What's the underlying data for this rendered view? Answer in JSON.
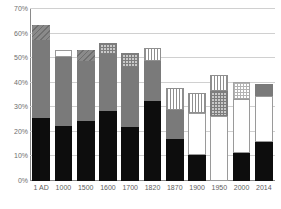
{
  "chart_data": {
    "type": "bar",
    "title": "",
    "subtitle": "",
    "xlabel": "",
    "ylabel": "",
    "stacked": true,
    "grid": true,
    "legend_position": "none",
    "ylim": [
      0,
      70
    ],
    "ytick_labels": [
      "0%",
      "10%",
      "20%",
      "30%",
      "40%",
      "50%",
      "60%",
      "70%"
    ],
    "ytick_values": [
      0,
      10,
      20,
      30,
      40,
      50,
      60,
      70
    ],
    "categories": [
      "1 AD",
      "1000",
      "1500",
      "1600",
      "1700",
      "1820",
      "1870",
      "1900",
      "1950",
      "2000",
      "2014"
    ],
    "series": [
      {
        "name": "segment-1",
        "fill": "black",
        "values": [
          25.5,
          22.5,
          24.5,
          28.5,
          22.0,
          32.5,
          17.0,
          10.5,
          0.0,
          11.5,
          16.0
        ]
      },
      {
        "name": "segment-2",
        "fill": "gray",
        "values": [
          32.0,
          28.0,
          24.5,
          23.0,
          24.5,
          16.5,
          12.0,
          0.0,
          0.0,
          0.0,
          0.0
        ]
      },
      {
        "name": "segment-3",
        "fill": "white",
        "values": [
          0.0,
          3.0,
          0.0,
          0.0,
          0.0,
          0.0,
          0.0,
          17.0,
          26.5,
          22.0,
          18.5
        ]
      },
      {
        "name": "segment-4",
        "fill": "pattern",
        "values": [
          6.0,
          0.0,
          4.5,
          4.5,
          5.5,
          5.0,
          9.0,
          8.5,
          10.0,
          7.0,
          5.0
        ]
      },
      {
        "name": "segment-5",
        "fill": "pattern-top",
        "values": [
          0.0,
          0.0,
          0.0,
          0.0,
          0.0,
          0.0,
          0.0,
          0.0,
          6.5,
          0.0,
          0.0
        ]
      }
    ],
    "totals": [
      63.5,
      53.5,
      53.5,
      56.0,
      52.0,
      54.0,
      38.0,
      36.0,
      43.0,
      40.5,
      39.5
    ],
    "bars": [
      {
        "category": "1 AD",
        "total": 63.5,
        "segments": [
          {
            "fill": "black",
            "value": 25.5,
            "from": 0.0,
            "to": 25.5
          },
          {
            "fill": "gray",
            "value": 32.0,
            "from": 25.5,
            "to": 57.5
          },
          {
            "fill": "diag",
            "value": 6.0,
            "from": 57.5,
            "to": 63.5
          }
        ]
      },
      {
        "category": "1000",
        "total": 53.5,
        "segments": [
          {
            "fill": "black",
            "value": 22.5,
            "from": 0.0,
            "to": 22.5
          },
          {
            "fill": "gray",
            "value": 28.0,
            "from": 22.5,
            "to": 50.5
          },
          {
            "fill": "white",
            "value": 3.0,
            "from": 50.5,
            "to": 53.5
          }
        ]
      },
      {
        "category": "1500",
        "total": 53.5,
        "segments": [
          {
            "fill": "black",
            "value": 24.5,
            "from": 0.0,
            "to": 24.5
          },
          {
            "fill": "gray",
            "value": 24.5,
            "from": 24.5,
            "to": 49.0
          },
          {
            "fill": "diag",
            "value": 4.5,
            "from": 49.0,
            "to": 53.5
          }
        ]
      },
      {
        "category": "1600",
        "total": 56.0,
        "segments": [
          {
            "fill": "black",
            "value": 28.5,
            "from": 0.0,
            "to": 28.5
          },
          {
            "fill": "gray",
            "value": 23.0,
            "from": 28.5,
            "to": 51.5
          },
          {
            "fill": "crosshatch",
            "value": 4.5,
            "from": 51.5,
            "to": 56.0
          }
        ]
      },
      {
        "category": "1700",
        "total": 52.0,
        "segments": [
          {
            "fill": "black",
            "value": 22.0,
            "from": 0.0,
            "to": 22.0
          },
          {
            "fill": "gray",
            "value": 24.5,
            "from": 22.0,
            "to": 46.5
          },
          {
            "fill": "crosshatch",
            "value": 5.5,
            "from": 46.5,
            "to": 52.0
          }
        ]
      },
      {
        "category": "1820",
        "total": 54.0,
        "segments": [
          {
            "fill": "black",
            "value": 32.5,
            "from": 0.0,
            "to": 32.5
          },
          {
            "fill": "gray",
            "value": 16.5,
            "from": 32.5,
            "to": 49.0
          },
          {
            "fill": "vstripe",
            "value": 5.0,
            "from": 49.0,
            "to": 54.0
          }
        ]
      },
      {
        "category": "1870",
        "total": 38.0,
        "segments": [
          {
            "fill": "black",
            "value": 17.0,
            "from": 0.0,
            "to": 17.0
          },
          {
            "fill": "gray",
            "value": 12.0,
            "from": 17.0,
            "to": 29.0
          },
          {
            "fill": "vstripe",
            "value": 9.0,
            "from": 29.0,
            "to": 38.0
          }
        ]
      },
      {
        "category": "1900",
        "total": 36.0,
        "segments": [
          {
            "fill": "black",
            "value": 10.5,
            "from": 0.0,
            "to": 10.5
          },
          {
            "fill": "white",
            "value": 17.0,
            "from": 10.5,
            "to": 27.5
          },
          {
            "fill": "vstripe",
            "value": 8.5,
            "from": 27.5,
            "to": 36.0
          }
        ]
      },
      {
        "category": "1950",
        "total": 43.0,
        "segments": [
          {
            "fill": "white",
            "value": 26.5,
            "from": 0.0,
            "to": 26.5
          },
          {
            "fill": "crosshatch",
            "value": 10.0,
            "from": 26.5,
            "to": 36.5
          },
          {
            "fill": "vstripe",
            "value": 6.5,
            "from": 36.5,
            "to": 43.0
          }
        ]
      },
      {
        "category": "2000",
        "total": 40.5,
        "segments": [
          {
            "fill": "black",
            "value": 11.5,
            "from": 0.0,
            "to": 11.5
          },
          {
            "fill": "white",
            "value": 22.0,
            "from": 11.5,
            "to": 33.5
          },
          {
            "fill": "checker-light",
            "value": 7.0,
            "from": 33.5,
            "to": 40.5
          }
        ]
      },
      {
        "category": "2014",
        "total": 39.5,
        "segments": [
          {
            "fill": "black",
            "value": 16.0,
            "from": 0.0,
            "to": 16.0
          },
          {
            "fill": "white",
            "value": 18.5,
            "from": 16.0,
            "to": 34.5
          },
          {
            "fill": "gray",
            "value": 5.0,
            "from": 34.5,
            "to": 39.5
          }
        ]
      }
    ],
    "colors": {
      "black": "#0d0d0d",
      "gray": "#7a7a7a",
      "white": "#ffffff",
      "pattern_line": "#8f8f8f",
      "gridline": "#d0d0d0",
      "axis": "#8a8a8a",
      "tick_text": "#6e6e6e"
    }
  }
}
